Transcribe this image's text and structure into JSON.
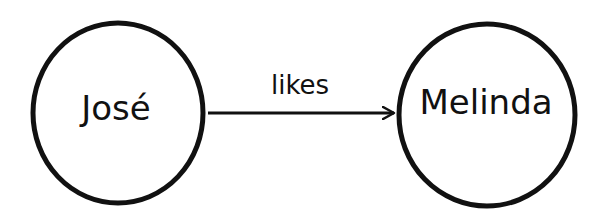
{
  "diagram": {
    "type": "directed-graph",
    "colors": {
      "stroke": "#111111",
      "background": "#ffffff",
      "text": "#111111"
    },
    "nodes": [
      {
        "id": "jose",
        "label": "José",
        "cx": 118,
        "cy": 113,
        "r": 88
      },
      {
        "id": "melinda",
        "label": "Melinda",
        "cx": 487,
        "cy": 115,
        "r": 90
      }
    ],
    "edges": [
      {
        "from": "jose",
        "to": "melinda",
        "label": "likes"
      }
    ]
  }
}
